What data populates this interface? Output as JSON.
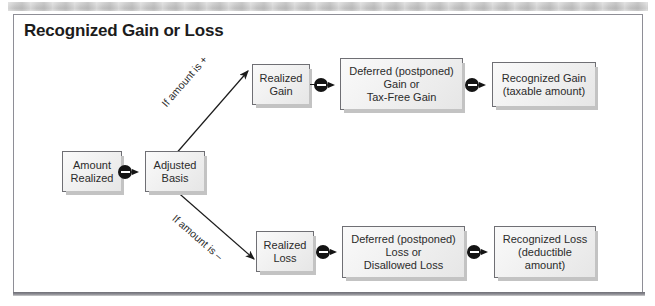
{
  "figure": {
    "title": "Recognized Gain or Loss",
    "frame_border_color": "#8e8e96",
    "node_fill_color": "#f1f1f1",
    "node_border_color": "#6f6f74",
    "connector_color": "#141414"
  },
  "nodes": [
    {
      "id": "amount-realized",
      "label": "Amount\nRealized"
    },
    {
      "id": "adjusted-basis",
      "label": "Adjusted\nBasis"
    },
    {
      "id": "realized-gain",
      "label": "Realized\nGain"
    },
    {
      "id": "deferred-gain",
      "label": "Deferred (postponed)\nGain or\nTax-Free Gain"
    },
    {
      "id": "recognized-gain",
      "label": "Recognized Gain\n(taxable amount)"
    },
    {
      "id": "realized-loss",
      "label": "Realized\nLoss"
    },
    {
      "id": "deferred-loss",
      "label": "Deferred (postponed)\nLoss or\nDisallowed Loss"
    },
    {
      "id": "recognized-loss",
      "label": "Recognized Loss\n(deductible\namount)"
    }
  ],
  "node_labels": {
    "amount_realized_line1": "Amount",
    "amount_realized_line2": "Realized",
    "adjusted_basis_line1": "Adjusted",
    "adjusted_basis_line2": "Basis",
    "realized_gain_line1": "Realized",
    "realized_gain_line2": "Gain",
    "deferred_gain_line1": "Deferred (postponed)",
    "deferred_gain_line2": "Gain or",
    "deferred_gain_line3": "Tax-Free Gain",
    "recognized_gain_line1": "Recognized Gain",
    "recognized_gain_line2": "(taxable amount)",
    "realized_loss_line1": "Realized",
    "realized_loss_line2": "Loss",
    "deferred_loss_line1": "Deferred (postponed)",
    "deferred_loss_line2": "Loss or",
    "deferred_loss_line3": "Disallowed Loss",
    "recognized_loss_line1": "Recognized Loss",
    "recognized_loss_line2": "(deductible",
    "recognized_loss_line3": "amount)"
  },
  "edge_labels": {
    "gain_branch": "If amount is +",
    "loss_branch": "If amount is –"
  },
  "connectors": [
    {
      "id": "minus-amount-to-basis",
      "operator": "−"
    },
    {
      "id": "minus-gain-to-deferred",
      "operator": "−"
    },
    {
      "id": "minus-deferred-to-recog-gain",
      "operator": "−"
    },
    {
      "id": "minus-loss-to-deferred",
      "operator": "−"
    },
    {
      "id": "minus-deferred-to-recog-loss",
      "operator": "−"
    }
  ]
}
